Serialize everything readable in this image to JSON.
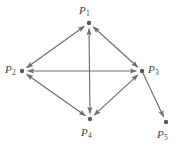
{
  "figure": {
    "kind": "directed-graph",
    "background_color": "#ffffff",
    "stroke_color": "#6e6e6e",
    "node_color": "#5a5a5a",
    "label_color": "#444444",
    "width": 182,
    "height": 148
  },
  "nodes": [
    {
      "id": "P1",
      "base": "P",
      "sub": "1",
      "x": 89,
      "y": 23,
      "label_x": 79,
      "label_y": 5
    },
    {
      "id": "P2",
      "base": "P",
      "sub": "2",
      "x": 22,
      "y": 71,
      "label_x": 5,
      "label_y": 64
    },
    {
      "id": "P3",
      "base": "P",
      "sub": "3",
      "x": 142,
      "y": 71,
      "label_x": 148,
      "label_y": 64
    },
    {
      "id": "P4",
      "base": "P",
      "sub": "4",
      "x": 90,
      "y": 119,
      "label_x": 81,
      "label_y": 127
    },
    {
      "id": "P5",
      "base": "P",
      "sub": "5",
      "x": 166,
      "y": 122,
      "label_x": 157,
      "label_y": 129
    }
  ],
  "edges": [
    {
      "from": "P1",
      "to": "P2",
      "bidirectional": true
    },
    {
      "from": "P1",
      "to": "P3",
      "bidirectional": true
    },
    {
      "from": "P1",
      "to": "P4",
      "bidirectional": true
    },
    {
      "from": "P2",
      "to": "P3",
      "bidirectional": true
    },
    {
      "from": "P2",
      "to": "P4",
      "bidirectional": true
    },
    {
      "from": "P3",
      "to": "P4",
      "bidirectional": true
    },
    {
      "from": "P3",
      "to": "P5",
      "bidirectional": false
    }
  ]
}
